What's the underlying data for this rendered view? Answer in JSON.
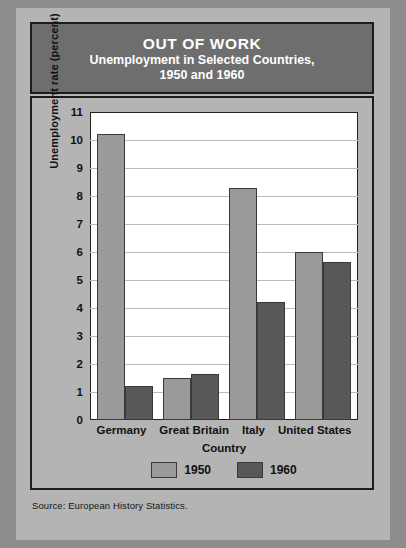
{
  "header": {
    "title_main": "OUT OF WORK",
    "title_sub_line1": "Unemployment in Selected Countries,",
    "title_sub_line2": "1950 and 1960"
  },
  "source": "Source: European History Statistics.",
  "colors": {
    "series_1950": "#9a9a9a",
    "series_1960": "#585858",
    "card_background": "#b4b4b4",
    "header_band": "#6e6e6e",
    "plot_background": "#ffffff",
    "gridline": "#b9b9b9",
    "outer_background": "#8c8c8c",
    "text": "#111111"
  },
  "chart_data": {
    "type": "bar",
    "xlabel": "Country",
    "ylabel": "Unemployment rate (percent)",
    "categories": [
      "Germany",
      "Great Britain",
      "Italy",
      "United States"
    ],
    "series": [
      {
        "name": "1950",
        "color": "#9a9a9a",
        "values": [
          10.2,
          1.5,
          8.3,
          6.0
        ]
      },
      {
        "name": "1960",
        "color": "#585858",
        "values": [
          1.2,
          1.65,
          4.2,
          5.65
        ]
      }
    ],
    "ylim": [
      0,
      11
    ],
    "yticks": [
      0,
      1,
      2,
      3,
      4,
      5,
      6,
      7,
      8,
      9,
      10,
      11
    ],
    "ytick_labels": [
      "0",
      "1",
      "2",
      "3",
      "4",
      "5",
      "6",
      "7",
      "8",
      "9",
      "10",
      "11"
    ],
    "grid": true,
    "grid_axis": "y",
    "legend": [
      "1950",
      "1960"
    ],
    "legend_position": "bottom-center"
  }
}
